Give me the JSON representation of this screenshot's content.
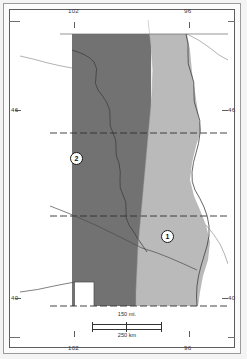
{
  "figure": {
    "type": "thematic-region-map",
    "title": "",
    "projection_note": ""
  },
  "graticule": {
    "longitude_labels": [
      "102",
      "96"
    ],
    "latitude_labels": [
      "46",
      "40"
    ],
    "top": [
      {
        "label": "102",
        "x_px": 74
      },
      {
        "label": "96",
        "x_px": 189
      }
    ],
    "bottom": [
      {
        "label": "102",
        "x_px": 74
      },
      {
        "label": "96",
        "x_px": 189
      }
    ],
    "left": [
      {
        "label": "46",
        "y_px": 110
      },
      {
        "label": "40",
        "y_px": 298
      }
    ],
    "right": [
      {
        "label": "46",
        "y_px": 110
      },
      {
        "label": "40",
        "y_px": 298
      }
    ]
  },
  "regions": [
    {
      "id": "1",
      "marker_label": "1",
      "fill_color": "#c9c9c9",
      "position": "eastern",
      "description": "light-shaded eastern region"
    },
    {
      "id": "2",
      "marker_label": "2",
      "fill_color": "#7b7b7b",
      "position": "western",
      "description": "dark-shaded western region"
    }
  ],
  "scale_bar": {
    "miles_label": "150 mi.",
    "kilometers_label": "250 km",
    "miles_value": 150,
    "kilometers_value": 250
  },
  "colors": {
    "region_dark": "#7b7b7b",
    "region_light": "#c9c9c9",
    "frame_outer": "#9a9a9a",
    "frame_inner": "#5d5d5d",
    "boundary_line": "#4a4a4a",
    "background": "#ffffff",
    "page": "#f2f2f2"
  }
}
